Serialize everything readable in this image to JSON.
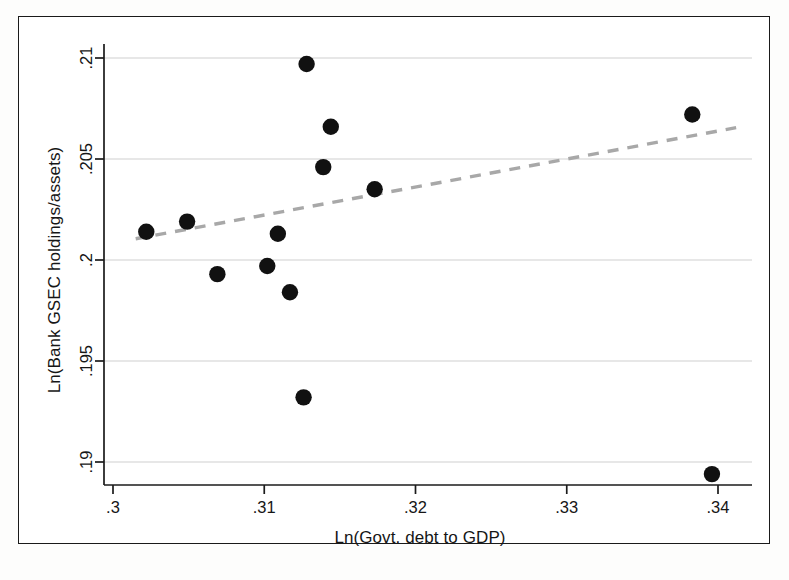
{
  "figure": {
    "background_color": "#ffffff",
    "frame_color": "#1a1a1a",
    "point_color": "#111111",
    "fit_line_color": "#a8a8a8",
    "grid_color": "#c9c9c9"
  },
  "chart_data": {
    "type": "scatter",
    "title": "",
    "subtitle": "",
    "xlabel": "Ln(Govt. debt to GDP)",
    "ylabel": "Ln(Bank GSEC holdings/assets)",
    "xlim": [
      0.2988,
      0.3425
    ],
    "ylim": [
      0.1888,
      0.2103
    ],
    "xticks": [
      0.3,
      0.31,
      0.32,
      0.33,
      0.34
    ],
    "xticklabels": [
      ".3",
      ".31",
      ".32",
      ".33",
      ".34"
    ],
    "yticks": [
      0.19,
      0.195,
      0.2,
      0.205,
      0.21
    ],
    "yticklabels": [
      ".19",
      ".195",
      ".2",
      ".205",
      ".21"
    ],
    "grid": "horizontal",
    "legend": "none",
    "points": [
      {
        "x": 0.3022,
        "y": 0.2014
      },
      {
        "x": 0.3049,
        "y": 0.2019
      },
      {
        "x": 0.3069,
        "y": 0.1993
      },
      {
        "x": 0.3102,
        "y": 0.1997
      },
      {
        "x": 0.3109,
        "y": 0.2013
      },
      {
        "x": 0.3117,
        "y": 0.1984
      },
      {
        "x": 0.3126,
        "y": 0.1932
      },
      {
        "x": 0.3128,
        "y": 0.2097
      },
      {
        "x": 0.3139,
        "y": 0.2046
      },
      {
        "x": 0.3144,
        "y": 0.2066
      },
      {
        "x": 0.3173,
        "y": 0.2035
      },
      {
        "x": 0.3383,
        "y": 0.2072
      },
      {
        "x": 0.3396,
        "y": 0.1894
      }
    ],
    "fit_line": {
      "style": "dashed",
      "x_start": 0.3015,
      "y_start": 0.20105,
      "x_end": 0.3412,
      "y_end": 0.20655
    }
  }
}
